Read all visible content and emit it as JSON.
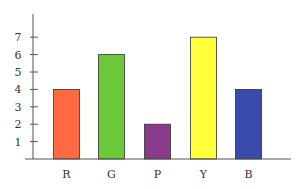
{
  "chart_data": {
    "type": "bar",
    "title": "",
    "xlabel": "",
    "ylabel": "",
    "categories": [
      "R",
      "G",
      "P",
      "Y",
      "B"
    ],
    "values": [
      4,
      6,
      2,
      7,
      4
    ],
    "colors": [
      "#FF6A42",
      "#6CC93A",
      "#8A3A8A",
      "#FFFF3A",
      "#3A4AAA"
    ],
    "yticks": [
      1,
      2,
      3,
      4,
      5,
      6,
      7
    ],
    "ylim": [
      0,
      8
    ],
    "grid": false,
    "legend": null
  },
  "style": {
    "axis_color": "#555555",
    "bar_border": "#333333"
  }
}
